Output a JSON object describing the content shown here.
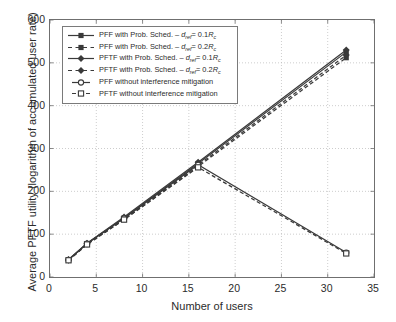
{
  "chart_data": {
    "type": "line",
    "title": "",
    "xlabel": "Number of users",
    "ylabel": "Average PFTF utility (logarithm of accumulated user rate)",
    "xlim": [
      0,
      35
    ],
    "ylim": [
      0,
      600
    ],
    "xticks": [
      0,
      5,
      10,
      15,
      20,
      25,
      30,
      35
    ],
    "yticks": [
      0,
      100,
      200,
      300,
      400,
      500,
      600
    ],
    "xtick_labels": [
      "0",
      "5",
      "10",
      "15",
      "20",
      "25",
      "30",
      "35"
    ],
    "ytick_labels": [
      "0",
      "100",
      "200",
      "300",
      "400",
      "500",
      "600"
    ],
    "grid": true,
    "grid_style": "dotted",
    "legend_position": "upper-left",
    "x": [
      2,
      4,
      8,
      16,
      32
    ],
    "series": [
      {
        "name": "PFF with Prob. Sched. - d_ref = 0.1 R_c",
        "values": [
          40,
          78,
          138,
          265,
          525
        ],
        "marker": "filled-square",
        "line": "solid",
        "color": "#3a3a3a"
      },
      {
        "name": "PFF with Prob. Sched. - d_ref = 0.2 R_c",
        "values": [
          39,
          76,
          134,
          258,
          512
        ],
        "marker": "filled-square",
        "line": "dashed",
        "color": "#3a3a3a"
      },
      {
        "name": "PFTF with Prob. Sched. - d_ref = 0.1 R_c",
        "values": [
          41,
          79,
          140,
          268,
          530
        ],
        "marker": "filled-diamond",
        "line": "solid",
        "color": "#3a3a3a"
      },
      {
        "name": "PFTF with Prob. Sched. - d_ref = 0.2 R_c",
        "values": [
          39,
          77,
          136,
          261,
          518
        ],
        "marker": "filled-diamond",
        "line": "dashed",
        "color": "#3a3a3a"
      },
      {
        "name": "PFF without interference mitigation",
        "values": [
          40,
          78,
          137,
          262,
          57
        ],
        "marker": "open-circle",
        "line": "solid",
        "color": "#3a3a3a"
      },
      {
        "name": "PFTF without interference mitigation",
        "values": [
          39,
          76,
          134,
          256,
          55
        ],
        "marker": "open-square",
        "line": "dashed",
        "color": "#3a3a3a"
      }
    ]
  },
  "legend": {
    "items": [
      {
        "prefix": "PFF with Prob. Sched. – ",
        "var": "d",
        "sub": "ref",
        "eq": "= 0.1",
        "unit": "R",
        "unit_sub": "c",
        "marker": "filled-square",
        "line": "solid"
      },
      {
        "prefix": "PFF with Prob. Sched. – ",
        "var": "d",
        "sub": "ref",
        "eq": "= 0.2",
        "unit": "R",
        "unit_sub": "c",
        "marker": "filled-square",
        "line": "dashed"
      },
      {
        "prefix": "PFTF with Prob. Sched. – ",
        "var": "d",
        "sub": "ref",
        "eq": "= 0.1",
        "unit": "R",
        "unit_sub": "c",
        "marker": "filled-diamond",
        "line": "solid"
      },
      {
        "prefix": "PFTF with Prob. Sched. – ",
        "var": "d",
        "sub": "ref",
        "eq": "= 0.2",
        "unit": "R",
        "unit_sub": "c",
        "marker": "filled-diamond",
        "line": "dashed"
      },
      {
        "prefix": "PFF without interference mitigation",
        "var": "",
        "sub": "",
        "eq": "",
        "unit": "",
        "unit_sub": "",
        "marker": "open-circle",
        "line": "short-solid"
      },
      {
        "prefix": "PFTF without interference mitigation",
        "var": "",
        "sub": "",
        "eq": "",
        "unit": "",
        "unit_sub": "",
        "marker": "open-square",
        "line": "short-dashed"
      }
    ]
  },
  "colors": {
    "axis": "#6f6f6f",
    "grid": "#b8b8b8",
    "series": "#3a3a3a",
    "text": "#2b2b2b",
    "background": "#ffffff"
  }
}
